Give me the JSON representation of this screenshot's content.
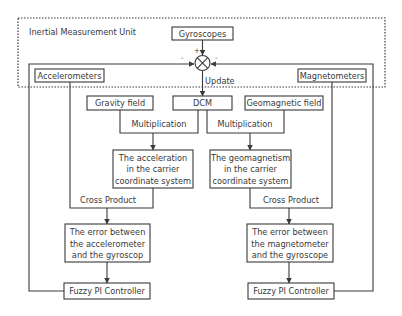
{
  "diagram": {
    "container_label": "Inertial Measurement Unit",
    "sensors": {
      "gyroscopes": "Gyroscopes",
      "accelerometers": "Accelerometers",
      "magnetometers": "Magnetometers"
    },
    "summing_junction": {
      "signs": {
        "top": "+",
        "left": "-",
        "right": "-"
      },
      "output_label": "Update"
    },
    "references": {
      "gravity_field": "Gravity field",
      "dcm": "DCM",
      "geomagnetic_field": "Geomagnetic field"
    },
    "operations": {
      "multiplication_left": "Multiplication",
      "multiplication_right": "Multiplication",
      "cross_product_left": "Cross Product",
      "cross_product_right": "Cross Product"
    },
    "transformed": {
      "acceleration": [
        "The acceleration",
        "in the carrier",
        "coordinate system"
      ],
      "geomagnetism": [
        "The geomagnetism",
        "in the carrier",
        "coordinate system"
      ]
    },
    "errors": {
      "accelerometer": [
        "The error between",
        "the accelerometer",
        "and the gyroscop"
      ],
      "magnetometer": [
        "The error between",
        "the magnetometer",
        "and the gyroscope"
      ]
    },
    "controllers": {
      "left": "Fuzzy PI Controller",
      "right": "Fuzzy PI Controller"
    }
  }
}
